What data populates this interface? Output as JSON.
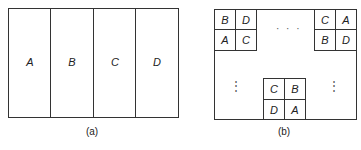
{
  "panel_a": {
    "caption": "(a)",
    "strips": [
      "A",
      "B",
      "C",
      "D"
    ]
  },
  "panel_b": {
    "caption": "(b)",
    "top_left_block": [
      "B",
      "D",
      "A",
      "C"
    ],
    "top_right_block": [
      "C",
      "A",
      "B",
      "D"
    ],
    "bottom_center_block": [
      "C",
      "B",
      "D",
      "A"
    ],
    "horizontal_ellipsis": "· · ·",
    "vertical_ellipsis": "⋮"
  }
}
